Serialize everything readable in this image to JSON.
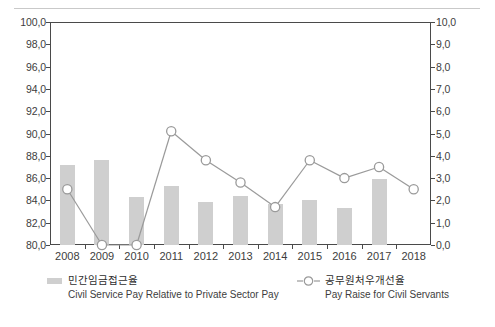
{
  "chart_data": {
    "type": "bar",
    "title": "",
    "subtitle": "",
    "xlabel": "",
    "ylabel": "",
    "grid": false,
    "legend_position": "bottom",
    "categories": [
      "2008",
      "2009",
      "2010",
      "2011",
      "2012",
      "2013",
      "2014",
      "2015",
      "2016",
      "2017",
      "2018"
    ],
    "axes": {
      "left": {
        "min": 80.0,
        "max": 100.0,
        "step": 2.0,
        "ticks": [
          "80,0",
          "82,0",
          "84,0",
          "86,0",
          "88,0",
          "90,0",
          "92,0",
          "94,0",
          "96,0",
          "98,0",
          "100,0"
        ],
        "tick_values": [
          80.0,
          82.0,
          84.0,
          86.0,
          88.0,
          90.0,
          92.0,
          94.0,
          96.0,
          98.0,
          100.0
        ]
      },
      "right": {
        "min": 0.0,
        "max": 10.0,
        "step": 1.0,
        "ticks": [
          "0,0",
          "1,0",
          "2,0",
          "3,0",
          "4,0",
          "5,0",
          "6,0",
          "7,0",
          "8,0",
          "9,0",
          "10,0"
        ],
        "tick_values": [
          0.0,
          1.0,
          2.0,
          3.0,
          4.0,
          5.0,
          6.0,
          7.0,
          8.0,
          9.0,
          10.0
        ]
      }
    },
    "series": [
      {
        "name": "민간임금접근율",
        "name_en": "Civil Service Pay Relative to Private Sector Pay",
        "type": "bar",
        "axis": "left",
        "color": "#cfcfcf",
        "values": [
          87.2,
          87.6,
          84.3,
          85.3,
          83.9,
          84.4,
          83.7,
          84.0,
          83.3,
          85.9,
          null
        ]
      },
      {
        "name": "공무원처우개선율",
        "name_en": "Pay Raise for Civil Servants",
        "type": "line",
        "axis": "right",
        "color": "#9a9a9a",
        "marker": "open-circle",
        "values": [
          2.5,
          0.0,
          0.0,
          5.1,
          3.8,
          2.8,
          1.7,
          3.8,
          3.0,
          3.5,
          2.5
        ]
      }
    ]
  },
  "legend": {
    "item1": {
      "ko": "민간임금접근율",
      "en": "Civil Service Pay Relative to Private Sector Pay",
      "swatch_color": "#cfcfcf"
    },
    "item2": {
      "ko": "공무원처우개선율",
      "en": "Pay Raise for Civil Servants",
      "marker_color": "#9a9a9a"
    }
  }
}
